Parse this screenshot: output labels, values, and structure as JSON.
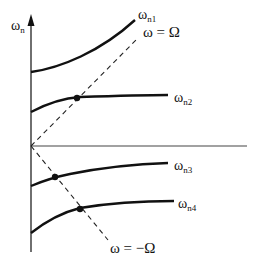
{
  "diagram": {
    "type": "frequency-vs-rotation-speed",
    "axis": {
      "y_label_main": "ω",
      "y_label_sub": "n"
    },
    "curves": [
      {
        "id": "n1",
        "label_main": "ω",
        "label_sub": "n1"
      },
      {
        "id": "n2",
        "label_main": "ω",
        "label_sub": "n2"
      },
      {
        "id": "n3",
        "label_main": "ω",
        "label_sub": "n3"
      },
      {
        "id": "n4",
        "label_main": "ω",
        "label_sub": "n4"
      }
    ],
    "reference_lines": [
      {
        "id": "plus",
        "label": "ω = Ω",
        "style": "dashed"
      },
      {
        "id": "minus",
        "label": "ω = −Ω",
        "style": "dashed"
      }
    ],
    "intersection_points": [
      {
        "curve": "n2",
        "line": "ω = Ω"
      },
      {
        "curve": "n3",
        "line": "ω = −Ω"
      },
      {
        "curve": "n4",
        "line": "ω = −Ω"
      }
    ],
    "colors": {
      "stroke": "#111111",
      "axis": "#333333",
      "background": "#ffffff"
    }
  }
}
